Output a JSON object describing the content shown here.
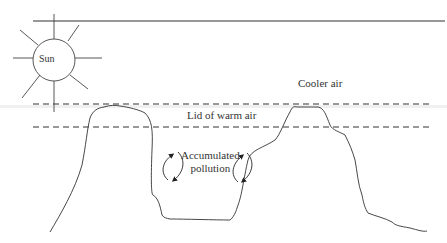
{
  "diagram": {
    "labels": {
      "sun": "Sun",
      "cooler_air": "Cooler air",
      "lid": "Lid of warm air",
      "pollution_line1": "Accumulated",
      "pollution_line2": "pollution"
    },
    "elements": [
      {
        "id": "sun",
        "type": "circle-with-rays",
        "label": "Sun"
      },
      {
        "id": "top-line",
        "type": "solid-line"
      },
      {
        "id": "upper-dashed",
        "type": "dashed-line"
      },
      {
        "id": "lower-dashed",
        "type": "dashed-line"
      },
      {
        "id": "terrain",
        "type": "valley-outline"
      },
      {
        "id": "left-circulation-arrows",
        "type": "curved-arrows"
      },
      {
        "id": "right-circulation-arrows",
        "type": "curved-arrows"
      }
    ],
    "colors": {
      "stroke": "#333333",
      "text": "#333333",
      "background": "#ffffff"
    }
  }
}
